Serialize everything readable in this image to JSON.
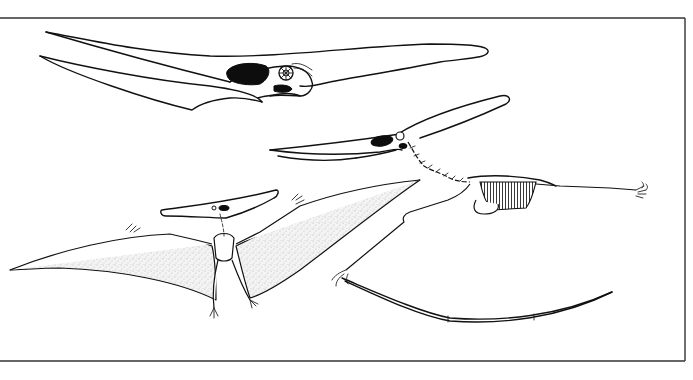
{
  "figure": {
    "panels": [
      {
        "id": "skull",
        "description": "Lateral view of crested skull with long toothless beak"
      },
      {
        "id": "walking-skeleton",
        "description": "Skeleton in quadrupedal walking pose with folded wing finger"
      },
      {
        "id": "flying-reconstruction",
        "description": "Dorsal-view flight reconstruction with stippled wing membranes"
      }
    ],
    "colors": {
      "line": "#111111",
      "background": "#ffffff",
      "membrane_stipple": "#8a8a8a",
      "frame": "#333333"
    },
    "frame": {
      "top_y": 18,
      "bottom_y": 361,
      "right_x": 685,
      "left_open": true
    }
  }
}
